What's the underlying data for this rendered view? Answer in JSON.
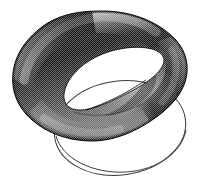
{
  "figure": {
    "title": "Shaded twisted band (Mobius-like knotted torus) with reference circle",
    "kind": "line-art-illustration",
    "background_color": "#ffffff",
    "canvas": {
      "width": 199,
      "height": 189
    },
    "texture": {
      "name": "halftone-dither",
      "dot_spacing_px": 2,
      "description": "Bitmap halftone screen producing gray levels on the solid surface"
    },
    "shading": {
      "darkest": "#0a0a0a",
      "dark": "#2b2b2b",
      "mid": "#5e5e5e",
      "light": "#9a9a9a",
      "highlight": "#d8d8d8",
      "outline": "#000000",
      "thin_line": "#3c3c3c"
    },
    "objects": [
      {
        "name": "twisted-band",
        "label": "Solid shaded twisted band",
        "role": "primary-surface",
        "fill": "halftone-gradient",
        "self_intersecting": true,
        "hole": {
          "name": "band-inner-hole",
          "label": "Inner opening of the band",
          "fill": "#ffffff"
        }
      },
      {
        "name": "reference-circle",
        "label": "Thin outlined reference circle in perspective",
        "role": "guide-outline",
        "stroke": "#3c3c3c",
        "stroke_width_px": 1,
        "fill": "none",
        "occluded_by": "twisted-band",
        "ellipse": {
          "center_x": 120,
          "center_y": 128,
          "radius_x": 66,
          "radius_y": 47,
          "rotation_deg": -8
        }
      },
      {
        "name": "fold-crease-line",
        "label": "Thin crease line marking the twist fold",
        "role": "detail-line",
        "stroke": "#1a1a1a",
        "stroke_width_px": 1
      }
    ]
  }
}
